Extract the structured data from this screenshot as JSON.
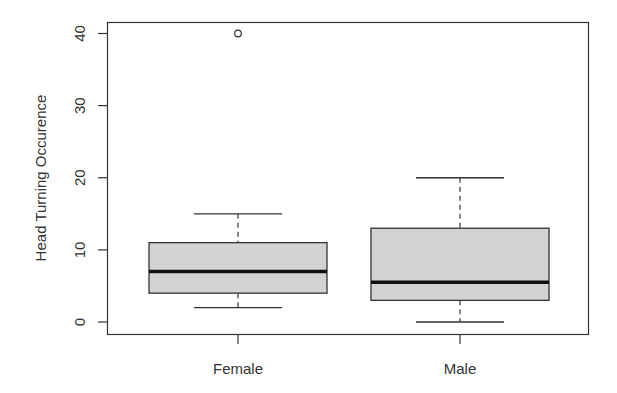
{
  "chart_data": {
    "type": "boxplot",
    "title": "",
    "xlabel": "",
    "ylabel": "Head Turning Occurence",
    "ylim": [
      0,
      40
    ],
    "yticks": [
      0,
      10,
      20,
      30,
      40
    ],
    "grid": false,
    "legend": null,
    "categories": [
      "Female",
      "Male"
    ],
    "series": [
      {
        "name": "Female",
        "whisker_low": 2,
        "q1": 4,
        "median": 7,
        "q3": 11,
        "whisker_high": 15,
        "outliers": [
          40
        ]
      },
      {
        "name": "Male",
        "whisker_low": 0,
        "q1": 3,
        "median": 5.5,
        "q3": 13,
        "whisker_high": 20,
        "outliers": []
      }
    ],
    "box_fill": "#d3d3d3",
    "line_color": "#333333"
  }
}
